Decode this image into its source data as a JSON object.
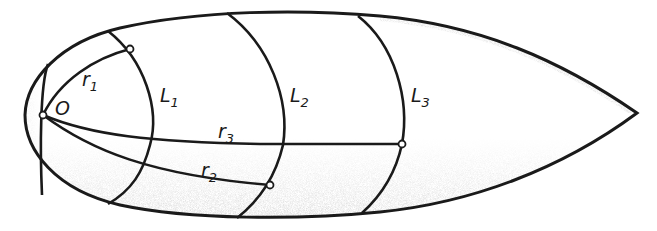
{
  "figure": {
    "colors": {
      "stroke": "#1a1a1a",
      "background": "#ffffff",
      "shading": "#8a8a8a"
    }
  },
  "labels": {
    "origin": "O",
    "r1": {
      "base": "r",
      "sub": "1"
    },
    "r2": {
      "base": "r",
      "sub": "2"
    },
    "r3": {
      "base": "r",
      "sub": "3"
    },
    "L1": {
      "base": "L",
      "sub": "1"
    },
    "L2": {
      "base": "L",
      "sub": "2"
    },
    "L3": {
      "base": "L",
      "sub": "3"
    }
  },
  "points": {
    "origin": {
      "x": 43,
      "y": 115
    },
    "r1_end": {
      "x": 130,
      "y": 49
    },
    "r2_end": {
      "x": 270,
      "y": 185
    },
    "r3_end": {
      "x": 402,
      "y": 144
    },
    "tip": {
      "x": 637,
      "y": 113
    }
  }
}
